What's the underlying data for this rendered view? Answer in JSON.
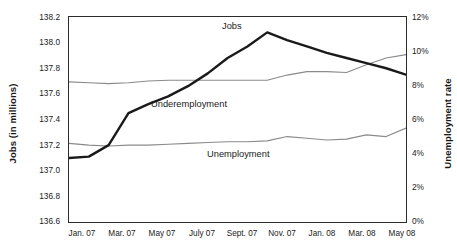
{
  "chart_data": {
    "type": "line",
    "title": "",
    "xlabel": "",
    "ylabel": "Jobs (in millions)",
    "ylabel_right": "Unemployment rate",
    "grid": false,
    "legend": "inline-annotations",
    "x": [
      "Jan. 07",
      "Feb. 07",
      "Mar. 07",
      "Apr. 07",
      "May 07",
      "June 07",
      "July 07",
      "Aug. 07",
      "Sept. 07",
      "Oct. 07",
      "Nov. 07",
      "Dec. 07",
      "Jan. 08",
      "Feb. 08",
      "Mar. 08",
      "Apr. 08",
      "May 08",
      "June 08"
    ],
    "x_tick_labels": [
      "Jan. 07",
      "Mar. 07",
      "May 07",
      "July 07",
      "Sept. 07",
      "Nov. 07",
      "Jan. 08",
      "Mar. 08",
      "May 08"
    ],
    "y_left": {
      "label": "Jobs (in millions)",
      "ticks": [
        "136.6",
        "136.8",
        "137.0",
        "137.2",
        "137.4",
        "137.6",
        "137.8",
        "138.0",
        "138.2"
      ],
      "min": 136.6,
      "max": 138.2,
      "step": 0.2
    },
    "y_right": {
      "label": "Unemployment rate",
      "ticks": [
        "0%",
        "2%",
        "4%",
        "6%",
        "8%",
        "10%",
        "12%"
      ],
      "min": 0,
      "max": 12,
      "step": 2
    },
    "series": [
      {
        "name": "Jobs",
        "axis": "left",
        "units": "millions",
        "color": "#1a1a1a",
        "style": "thick",
        "values": [
          137.1,
          137.11,
          137.2,
          137.45,
          137.52,
          137.58,
          137.66,
          137.76,
          137.88,
          137.97,
          138.08,
          138.02,
          137.97,
          137.92,
          137.88,
          137.84,
          137.8,
          137.75
        ]
      },
      {
        "name": "Underemployment",
        "axis": "right",
        "units": "percent",
        "color": "#8a8a8a",
        "style": "thin",
        "values": [
          8.2,
          8.15,
          8.1,
          8.15,
          8.25,
          8.3,
          8.3,
          8.3,
          8.3,
          8.3,
          8.3,
          8.6,
          8.8,
          8.8,
          8.75,
          9.2,
          9.6,
          9.8
        ]
      },
      {
        "name": "Unemployment",
        "axis": "right",
        "units": "percent",
        "color": "#8a8a8a",
        "style": "thin",
        "values": [
          4.6,
          4.5,
          4.45,
          4.5,
          4.5,
          4.55,
          4.6,
          4.65,
          4.7,
          4.7,
          4.75,
          5.0,
          4.9,
          4.8,
          4.85,
          5.1,
          5.0,
          5.5
        ]
      }
    ],
    "annotations": [
      {
        "text": "Jobs",
        "series": "Jobs"
      },
      {
        "text": "Underemployment",
        "series": "Underemployment"
      },
      {
        "text": "Unemployment",
        "series": "Unemployment"
      }
    ]
  }
}
